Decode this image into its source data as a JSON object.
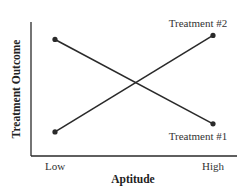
{
  "chart_data": {
    "type": "line",
    "title": "",
    "xlabel": "Aptitude",
    "ylabel": "Treatment Outcome",
    "categories": [
      "Low",
      "High"
    ],
    "ylim": [
      0,
      1
    ],
    "grid": false,
    "series": [
      {
        "name": "Treatment #1",
        "values": [
          0.87,
          0.24
        ]
      },
      {
        "name": "Treatment #2",
        "values": [
          0.18,
          0.9
        ]
      }
    ]
  }
}
